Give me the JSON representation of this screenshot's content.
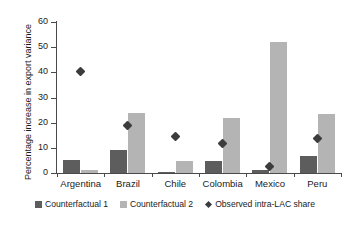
{
  "chart_data": {
    "type": "bar",
    "title": "",
    "xlabel": "",
    "ylabel": "Percentage increase in export variance",
    "ylim": [
      0,
      60
    ],
    "yticks": [
      0,
      10,
      20,
      30,
      40,
      50,
      60
    ],
    "grid": false,
    "legend_position": "bottom",
    "categories": [
      "Argentina",
      "Brazil",
      "Chile",
      "Colombia",
      "Mexico",
      "Peru"
    ],
    "series": [
      {
        "name": "Counterfactual 1",
        "type": "bar",
        "color": "#5d5d5d",
        "values": [
          5.2,
          9.1,
          0.3,
          4.7,
          1.3,
          6.7
        ]
      },
      {
        "name": "Counterfactual 2",
        "type": "bar",
        "color": "#b4b4b4",
        "values": [
          1.3,
          23.8,
          4.7,
          21.8,
          52.0,
          23.4
        ]
      },
      {
        "name": "Observed intra-LAC share",
        "type": "scatter",
        "marker": "diamond",
        "color": "#3c3c3c",
        "values": [
          40.3,
          18.8,
          14.7,
          11.9,
          2.5,
          13.9
        ]
      }
    ]
  },
  "axis": {
    "y_title": "Percentage increase in export variance",
    "y_tick_labels": [
      "0",
      "10",
      "20",
      "30",
      "40",
      "50",
      "60"
    ],
    "x_tick_labels": [
      "Argentina",
      "Brazil",
      "Chile",
      "Colombia",
      "Mexico",
      "Peru"
    ]
  },
  "legend": {
    "items": [
      {
        "label": "Counterfactual 1"
      },
      {
        "label": "Counterfactual 2"
      },
      {
        "label": "Observed intra-LAC share"
      }
    ]
  }
}
